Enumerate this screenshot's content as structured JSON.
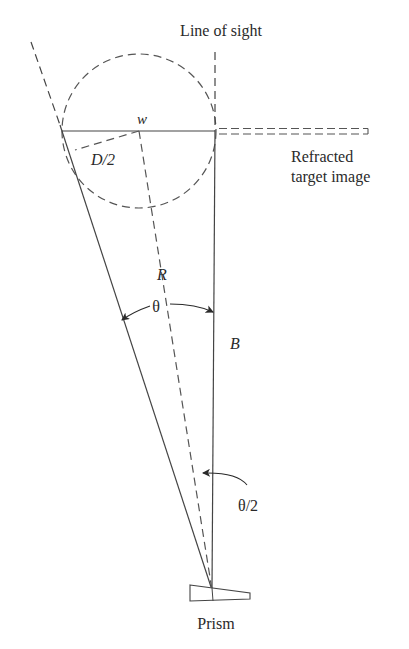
{
  "diagram": {
    "title_label": "Line of sight",
    "refracted_label_line1": "Refracted",
    "refracted_label_line2": "target image",
    "w_label": "w",
    "d2_label": "D/2",
    "r_label": "R",
    "theta_label": "θ",
    "b_label": "B",
    "half_theta_label": "θ/2",
    "prism_label": "Prism",
    "colors": {
      "stroke": "#3a3a3a",
      "text": "#2a2a2a",
      "background": "#ffffff"
    }
  }
}
